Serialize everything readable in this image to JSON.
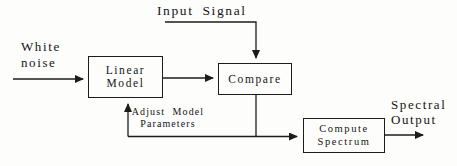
{
  "colors": {
    "background": "#fdfdfc",
    "boxbg": "#fdfdfc",
    "line": "#1c1c1c",
    "text": "#141414"
  },
  "labels": {
    "white_noise": {
      "line1": "White",
      "line2": "noise"
    },
    "input_signal": "Input Signal",
    "adjust": {
      "line1": "Adjust Model",
      "line2": "Parameters"
    },
    "spectral": {
      "line1": "Spectral",
      "line2": "Output"
    }
  },
  "nodes": {
    "linear_model": {
      "line1": "Linear",
      "line2": "Model"
    },
    "compare": {
      "label": "Compare"
    },
    "compute_spectrum": {
      "line1": "Compute",
      "line2": "Spectrum"
    }
  }
}
